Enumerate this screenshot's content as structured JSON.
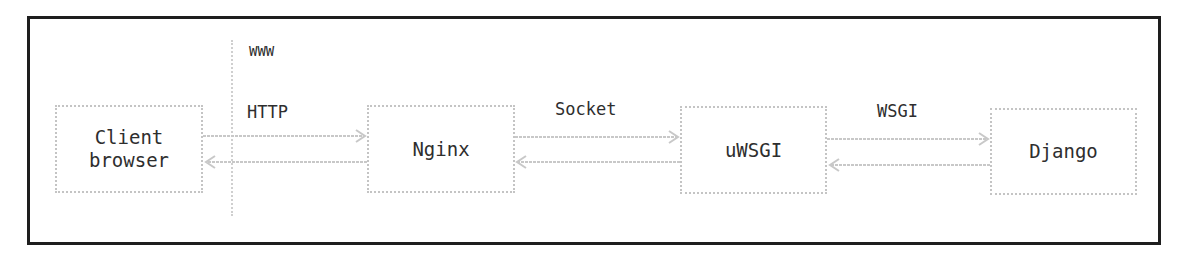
{
  "diagram": {
    "type": "architecture-flow",
    "zone_label": "WWW",
    "nodes": [
      {
        "id": "client",
        "label": "Client\nbrowser",
        "x": 55,
        "y": 105,
        "w": 148,
        "h": 88
      },
      {
        "id": "nginx",
        "label": "Nginx",
        "x": 367,
        "y": 105,
        "w": 148,
        "h": 88
      },
      {
        "id": "uwsgi",
        "label": "uWSGI",
        "x": 680,
        "y": 106,
        "w": 147,
        "h": 88
      },
      {
        "id": "django",
        "label": "Django",
        "x": 990,
        "y": 108,
        "w": 147,
        "h": 87
      }
    ],
    "edges": [
      {
        "from": "client",
        "to": "nginx",
        "label": "HTTP",
        "bidirectional": true
      },
      {
        "from": "nginx",
        "to": "uwsgi",
        "label": "Socket",
        "bidirectional": true
      },
      {
        "from": "uwsgi",
        "to": "django",
        "label": "WSGI",
        "bidirectional": true
      }
    ],
    "colors": {
      "frame": "#1e1e1e",
      "node_border": "#c4c4c4",
      "arrow": "#c8c8c8",
      "text": "#2e2e2e"
    }
  }
}
